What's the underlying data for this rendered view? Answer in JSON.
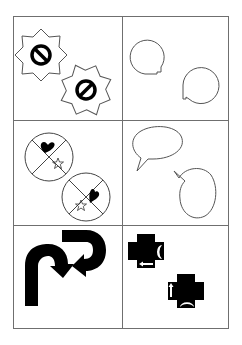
{
  "puzzle": {
    "layout": "3 rows x 2 columns figure grid",
    "colors": {
      "line": "#6f6f6f",
      "shape_stroke": "#555555",
      "fill": "#000000",
      "background": "#ffffff"
    },
    "cells": [
      {
        "row": 1,
        "col": 1,
        "content": "two eight-point starburst badges each containing a prohibition (no-entry) sign, second rotated"
      },
      {
        "row": 1,
        "col": 2,
        "content": "two round speech bubbles with small notched tail, second rotated"
      },
      {
        "row": 2,
        "col": 1,
        "content": "two circles divided into quadrants with a black heart and an outlined star, second rotated"
      },
      {
        "row": 2,
        "col": 2,
        "content": "two oval speech bubbles with pointed tails, second rotated"
      },
      {
        "row": 3,
        "col": 1,
        "content": "two thick black U-turn arrows, second rotated"
      },
      {
        "row": 3,
        "col": 2,
        "content": "two black crosses with white crescent and white arrow marks, second rotated"
      }
    ]
  }
}
